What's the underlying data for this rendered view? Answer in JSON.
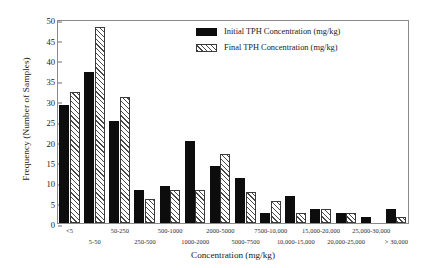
{
  "chart_data": {
    "type": "bar",
    "title": "",
    "xlabel": "Concentration (mg/kg)",
    "ylabel": "Frequency (Number of Samples)",
    "ylim": [
      0,
      50
    ],
    "ytick_values": [
      0,
      5,
      10,
      15,
      20,
      25,
      30,
      35,
      40,
      45,
      50
    ],
    "grid": false,
    "legend_position": "top-right",
    "categories": [
      "<5",
      "5-50",
      "50-250",
      "250-500",
      "500-1000",
      "1000-2000",
      "2000-5000",
      "5000-7500",
      "7500-10,000",
      "10,000-15,000",
      "15,000-20,000",
      "20,000-25,000",
      "25,000-30,000",
      "> 30,000"
    ],
    "series": [
      {
        "name": "Initial TPH Concentration (mg/kg)",
        "values": [
          29,
          37,
          25,
          8,
          9,
          20,
          14,
          11,
          2.5,
          6.5,
          3.5,
          2.5,
          1.5,
          3.5
        ]
      },
      {
        "name": "Final TPH Concentration (mg/kg)",
        "values": [
          32,
          48,
          31,
          6,
          8,
          8,
          17,
          7.5,
          5.5,
          2.5,
          3.5,
          2.5,
          0,
          1.5
        ]
      }
    ]
  },
  "legend": {
    "items": [
      {
        "label": "Initial TPH Concentration (mg/kg)",
        "swatch": "solid-black-swatch"
      },
      {
        "label": "Final TPH Concentration (mg/kg)",
        "swatch": "hatched-swatch"
      }
    ]
  }
}
